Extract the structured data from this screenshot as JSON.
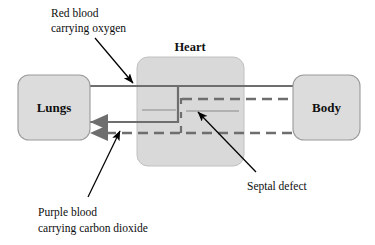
{
  "diagram": {
    "title_visible": false,
    "palette": {
      "box_fill": "#dcdcdc",
      "box_stroke": "#9a9a9a",
      "heart_fill": "#d9d9d9",
      "heart_stroke": "#b4b4b4",
      "vessel_gray": "#6e6e6e",
      "vessel_dark": "#5a5a5a",
      "pointer_black": "#000000",
      "text_color": "#0d0d0d",
      "background": "#ffffff"
    },
    "boxes": [
      {
        "id": "lungs",
        "label": "Lungs",
        "x": 18,
        "y": 75,
        "width": 72,
        "height": 65
      },
      {
        "id": "heart",
        "label": "Heart",
        "x": 137,
        "y": 57,
        "width": 107,
        "height": 109
      },
      {
        "id": "body",
        "label": "Body",
        "x": 293,
        "y": 75,
        "width": 67,
        "height": 65
      }
    ],
    "heart_title": "Heart",
    "annotations": [
      {
        "id": "red-blood",
        "lines": [
          "Red blood",
          "carrying oxygen"
        ],
        "text_x": 51,
        "text_y": 14,
        "pointer_from": [
          95,
          38
        ],
        "pointer_to": [
          134,
          84
        ]
      },
      {
        "id": "purple-blood",
        "lines": [
          "Purple blood",
          "carrying carbon dioxide"
        ],
        "text_x": 38,
        "text_y": 213,
        "pointer_from": [
          88,
          197
        ],
        "pointer_to": [
          119,
          130
        ]
      },
      {
        "id": "septal-defect",
        "lines": [
          "Septal defect"
        ],
        "text_x": 247,
        "text_y": 189,
        "pointer_from": [
          256,
          172
        ],
        "pointer_to": [
          197,
          111
        ]
      }
    ],
    "flows": [
      {
        "id": "lungs-to-heart-oxygenated",
        "style": "solid",
        "direction": "right",
        "description": "Red blood carrying oxygen from lungs into heart"
      },
      {
        "id": "heart-to-body-oxygenated",
        "style": "solid",
        "direction": "right",
        "description": "Red blood carrying oxygen from heart to body"
      },
      {
        "id": "heart-to-body-mixed",
        "style": "dashed",
        "direction": "right",
        "description": "Purple blood shunted through septal defect to body"
      },
      {
        "id": "body-to-heart-deoxygenated",
        "style": "dashed",
        "direction": "left",
        "description": "Purple blood carrying carbon dioxide returning from body"
      },
      {
        "id": "heart-to-lungs-deoxygenated",
        "style": "solid",
        "direction": "left",
        "description": "Blood from heart back to lungs"
      }
    ],
    "septal_defect_marker": {
      "description": "Gap in the dashed septum wall between heart chambers",
      "x": 181,
      "y_top": 104,
      "y_bottom": 132
    }
  }
}
